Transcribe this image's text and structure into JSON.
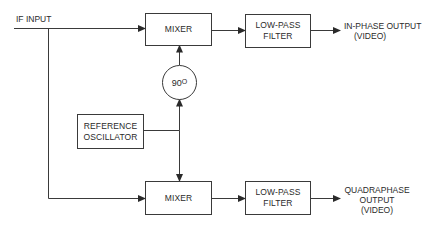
{
  "diagram": {
    "title": "",
    "colors": {
      "line": "#3a3a3a",
      "text": "#2a2a2a",
      "background": "#ffffff"
    },
    "input": {
      "label": "IF INPUT"
    },
    "top_mixer": {
      "label": "MIXER"
    },
    "bottom_mixer": {
      "label": "MIXER"
    },
    "top_filter": {
      "line1": "LOW-PASS",
      "line2": "FILTER"
    },
    "bottom_filter": {
      "line1": "LOW-PASS",
      "line2": "FILTER"
    },
    "phase_shifter": {
      "value": "90",
      "unit": "O"
    },
    "oscillator": {
      "line1": "REFERENCE",
      "line2": "OSCILLATOR"
    },
    "in_phase_output": {
      "line1": "IN-PHASE OUTPUT",
      "line2": "(VIDEO)"
    },
    "quadraphase_output": {
      "line1": "QUADRAPHASE",
      "line2": "OUTPUT",
      "line3": "(VIDEO)"
    },
    "connections": [
      {
        "from": "IF INPUT",
        "to": "top_mixer"
      },
      {
        "from": "IF INPUT",
        "to": "bottom_mixer"
      },
      {
        "from": "top_mixer",
        "to": "top_filter"
      },
      {
        "from": "top_filter",
        "to": "in_phase_output"
      },
      {
        "from": "oscillator",
        "to": "phase_shifter"
      },
      {
        "from": "phase_shifter",
        "to": "top_mixer"
      },
      {
        "from": "oscillator",
        "to": "bottom_mixer"
      },
      {
        "from": "bottom_mixer",
        "to": "bottom_filter"
      },
      {
        "from": "bottom_filter",
        "to": "quadraphase_output"
      }
    ]
  }
}
